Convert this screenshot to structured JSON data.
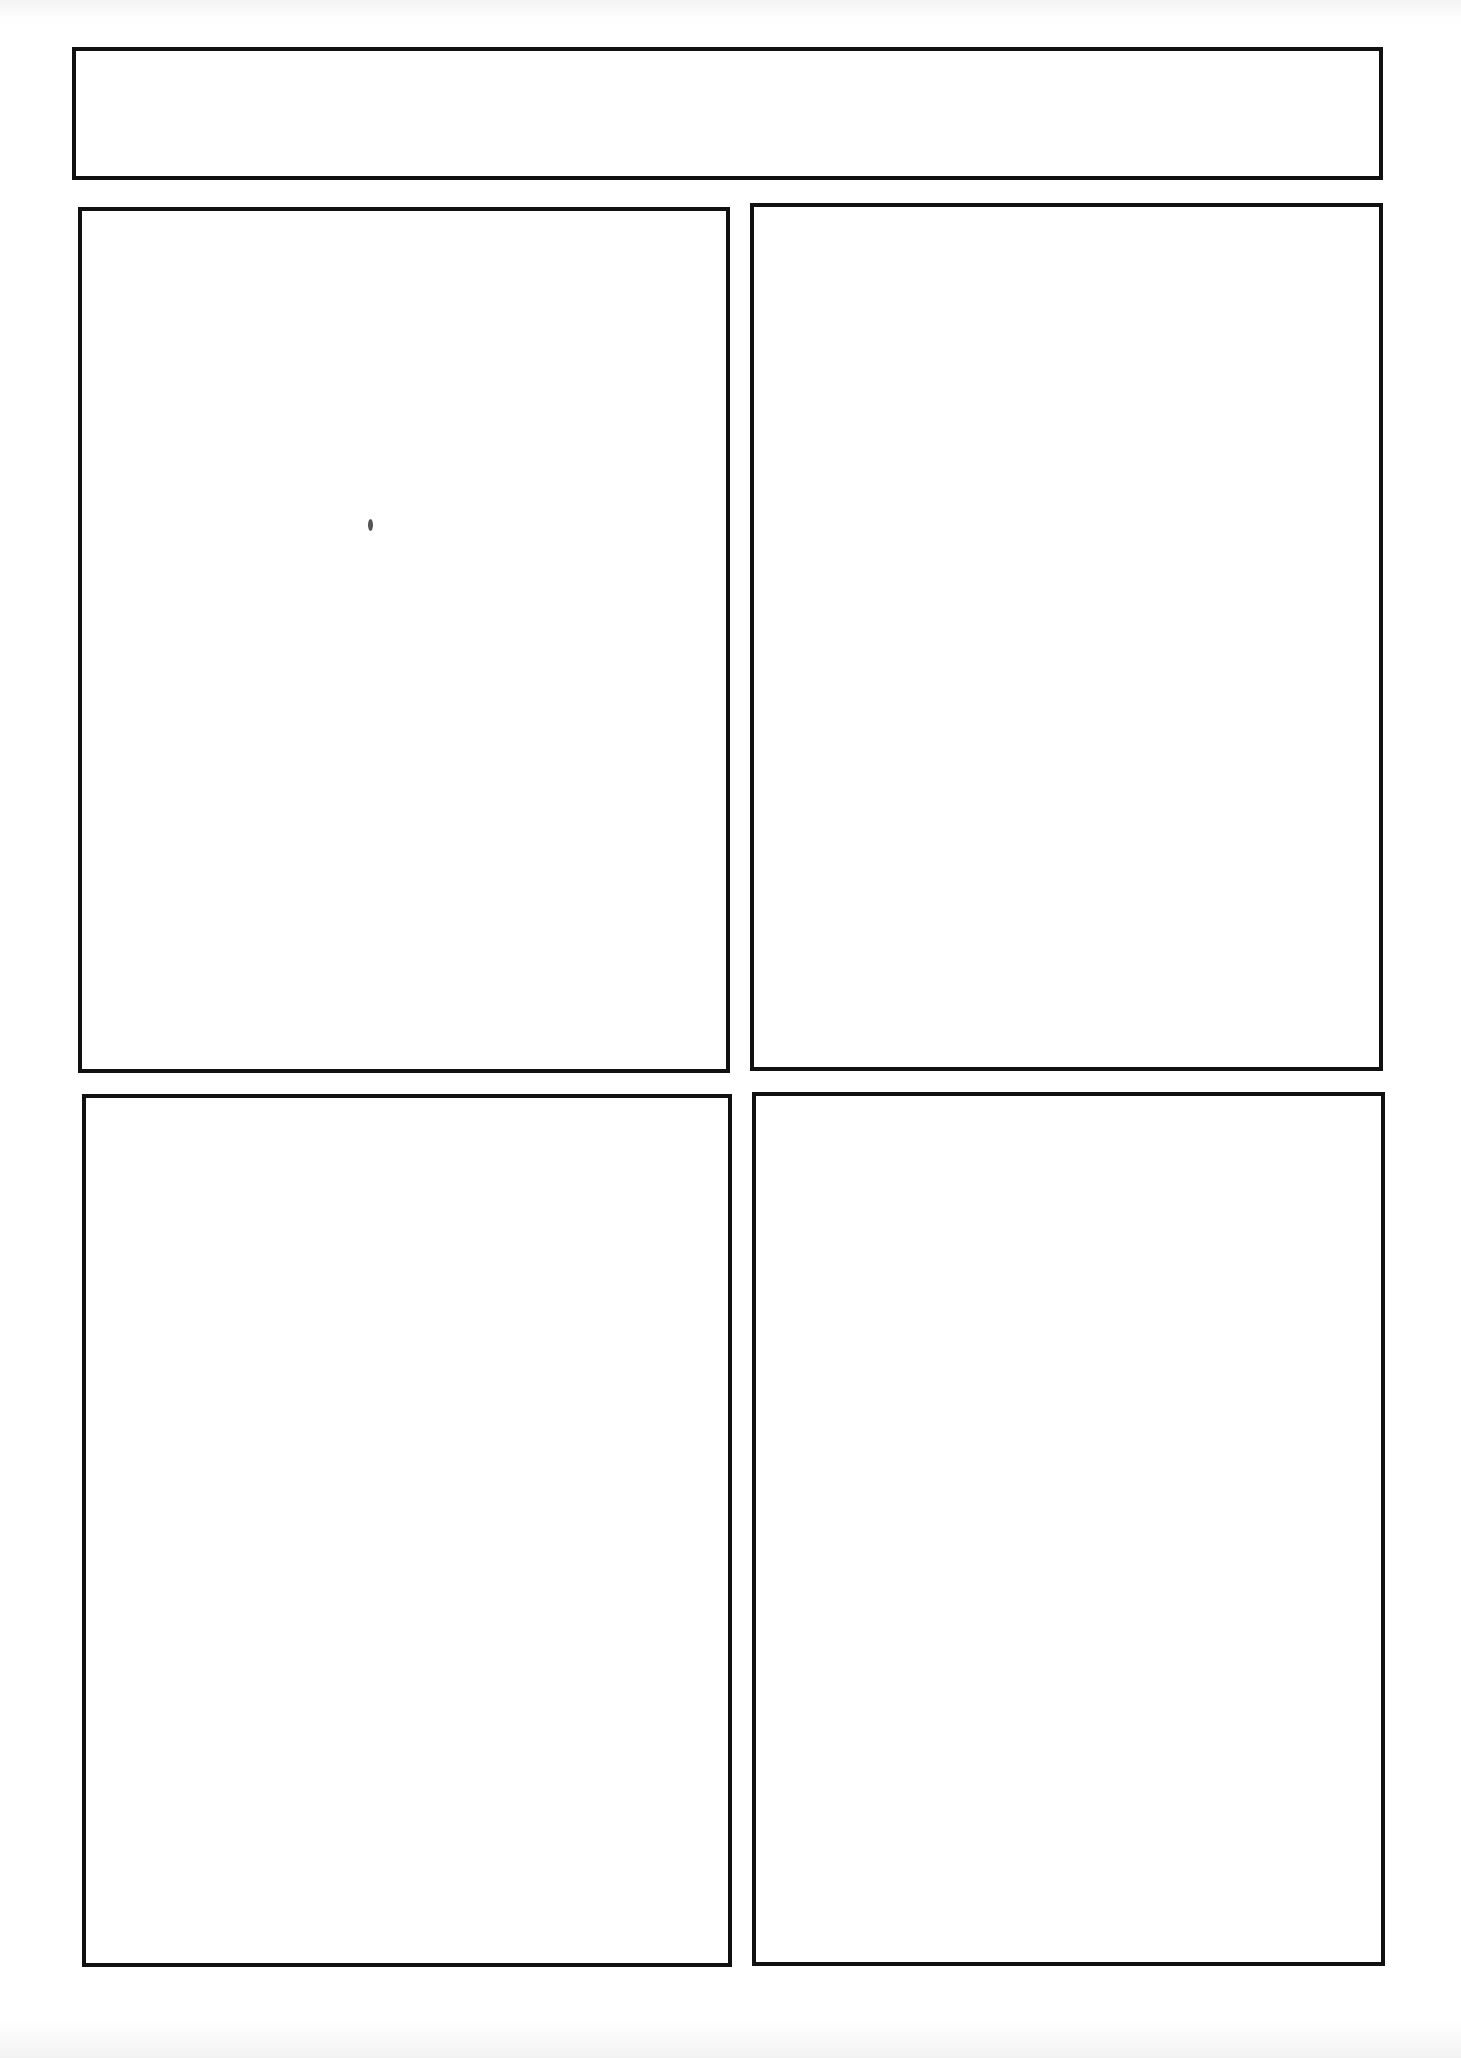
{
  "page": {
    "type": "comic-panel-template",
    "background_color": "#ffffff",
    "border_color": "#111111"
  },
  "frames": [
    {
      "id": "title-box",
      "role": "title",
      "x": 72,
      "y": 47,
      "w": 1311,
      "h": 133
    },
    {
      "id": "panel-1",
      "role": "panel",
      "x": 78,
      "y": 207,
      "w": 652,
      "h": 866
    },
    {
      "id": "panel-2",
      "role": "panel",
      "x": 750,
      "y": 203,
      "w": 633,
      "h": 868
    },
    {
      "id": "panel-3",
      "role": "panel",
      "x": 82,
      "y": 1094,
      "w": 650,
      "h": 873
    },
    {
      "id": "panel-4",
      "role": "panel",
      "x": 752,
      "y": 1092,
      "w": 633,
      "h": 874
    }
  ]
}
